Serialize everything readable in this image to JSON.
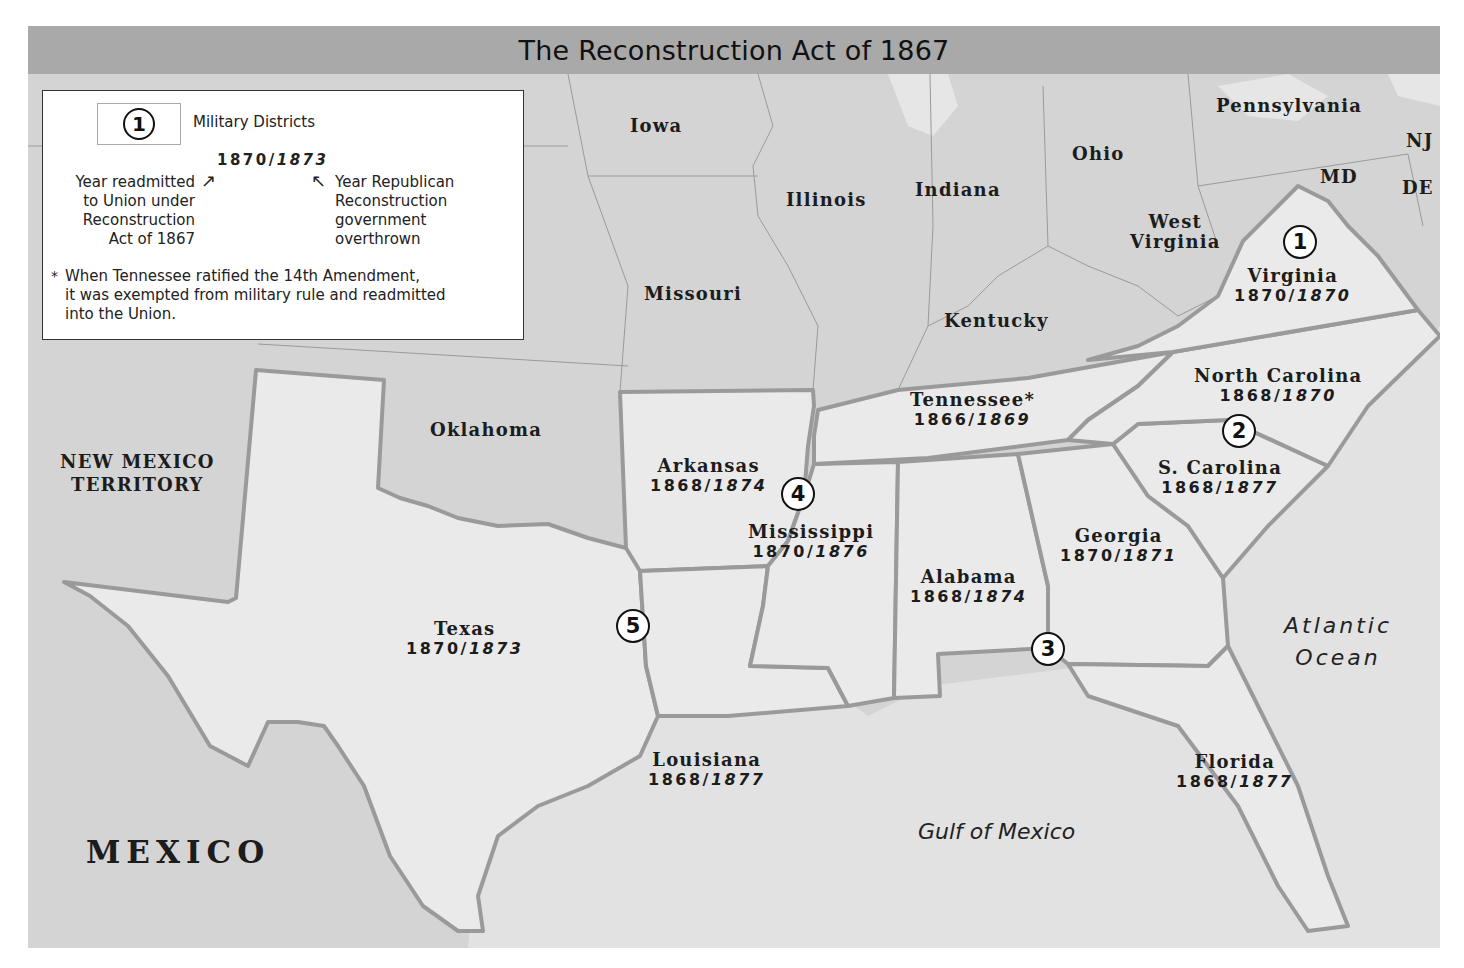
{
  "title": "The Reconstruction Act of 1867",
  "legend": {
    "symbol_value": "1",
    "symbol_label": "Military Districts",
    "example_readmitted": "1870/",
    "example_overthrown": "1873",
    "left_note": [
      "Year readmitted",
      "to Union under",
      "Reconstruction",
      "Act of 1867"
    ],
    "right_note": [
      "Year Republican",
      "Reconstruction",
      "government",
      "overthrown"
    ],
    "footnote_mark": "*",
    "footnote": [
      "When Tennessee ratified the 14th Amendment,",
      "it was exempted from military rule and readmitted",
      "into the Union."
    ]
  },
  "reconstruction_states": [
    {
      "name": "Virginia",
      "readmitted": "1870/",
      "overthrown": "1870"
    },
    {
      "name": "North Carolina",
      "readmitted": "1868/",
      "overthrown": "1870"
    },
    {
      "name": "S. Carolina",
      "readmitted": "1868/",
      "overthrown": "1877"
    },
    {
      "name": "Georgia",
      "readmitted": "1870/",
      "overthrown": "1871"
    },
    {
      "name": "Florida",
      "readmitted": "1868/",
      "overthrown": "1877"
    },
    {
      "name": "Alabama",
      "readmitted": "1868/",
      "overthrown": "1874"
    },
    {
      "name": "Mississippi",
      "readmitted": "1870/",
      "overthrown": "1876"
    },
    {
      "name": "Louisiana",
      "readmitted": "1868/",
      "overthrown": "1877"
    },
    {
      "name": "Arkansas",
      "readmitted": "1868/",
      "overthrown": "1874"
    },
    {
      "name": "Texas",
      "readmitted": "1870/",
      "overthrown": "1873"
    },
    {
      "name": "Tennessee*",
      "readmitted": "1866/",
      "overthrown": "1869"
    }
  ],
  "other_regions": {
    "iowa": "Iowa",
    "illinois": "Illinois",
    "indiana": "Indiana",
    "ohio": "Ohio",
    "pennsylvania": "Pennsylvania",
    "nj": "NJ",
    "md": "MD",
    "de": "DE",
    "west_virginia_1": "West",
    "west_virginia_2": "Virginia",
    "missouri": "Missouri",
    "kentucky": "Kentucky",
    "oklahoma": "Oklahoma",
    "new_mexico_1": "NEW MEXICO",
    "new_mexico_2": "TERRITORY",
    "mexico": "MEXICO"
  },
  "water": {
    "atlantic_1": "Atlantic",
    "atlantic_2": "Ocean",
    "gulf": "Gulf of Mexico"
  },
  "districts": [
    {
      "number": "1",
      "state": "Virginia"
    },
    {
      "number": "2",
      "state": "North Carolina / South Carolina"
    },
    {
      "number": "3",
      "state": "Georgia / Alabama / Florida"
    },
    {
      "number": "4",
      "state": "Mississippi / Arkansas"
    },
    {
      "number": "5",
      "state": "Texas / Louisiana"
    }
  ],
  "colors": {
    "title_bar": "#a9a9a9",
    "union_states": "#d4d4d4",
    "reconstruction_states": "#e9e9e9",
    "water": "#e2e2e2",
    "border_thick": "#9a9a9a"
  }
}
